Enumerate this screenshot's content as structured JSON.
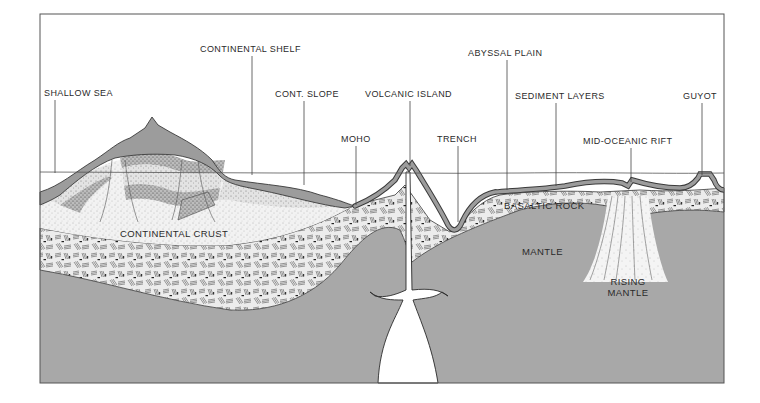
{
  "diagram": {
    "colors": {
      "background": "#ffffff",
      "frame": "#555555",
      "mantle": "#a9a9a9",
      "sediment": "#9a9a9a",
      "continental_crust": "#efefef",
      "basaltic_rock": "#e2e2e2",
      "magma": "#ffffff",
      "line": "#3a3a3a"
    },
    "labels": {
      "shallow_sea": "SHALLOW SEA",
      "continental_shelf": "CONTINENTAL SHELF",
      "cont_slope": "CONT. SLOPE",
      "moho": "MOHO",
      "volcanic_island": "VOLCANIC ISLAND",
      "trench": "TRENCH",
      "abyssal_plain": "ABYSSAL PLAIN",
      "sediment_layers": "SEDIMENT LAYERS",
      "mid_oceanic_rift": "MID-OCEANIC RIFT",
      "guyot": "GUYOT"
    },
    "region_labels": {
      "continental_crust": "CONTINENTAL CRUST",
      "basaltic_rock": "BASALTIC ROCK",
      "mantle": "MANTLE",
      "rising_mantle_line1": "RISING",
      "rising_mantle_line2": "MANTLE"
    }
  }
}
